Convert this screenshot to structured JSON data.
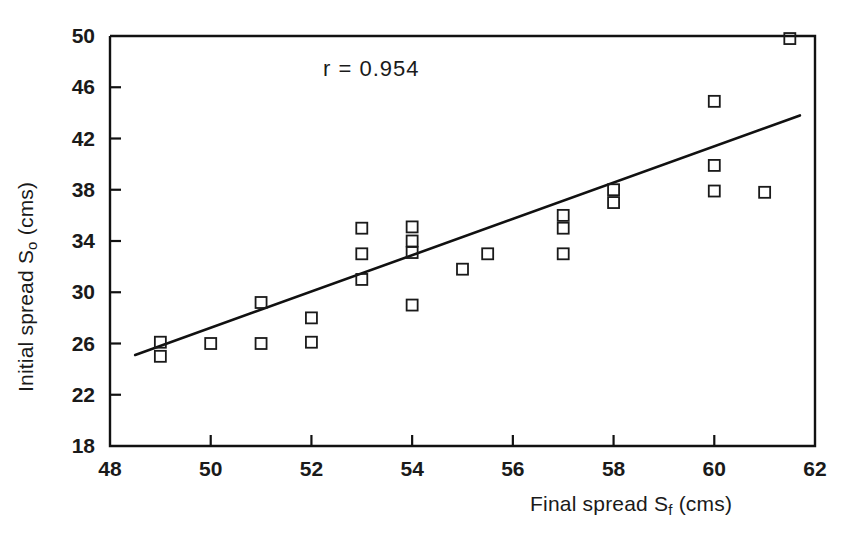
{
  "chart_data": {
    "type": "scatter",
    "title": "",
    "xlabel": "Final spread S_f (cms)",
    "ylabel": "Initial spread S_o (cms)",
    "xlabel_parts": {
      "pre": "Final spread S",
      "sub": "f",
      "post": " (cms)"
    },
    "ylabel_parts": {
      "pre": "Initial spread S",
      "sub": "o",
      "post": " (cms)"
    },
    "xlim": [
      48,
      62
    ],
    "ylim": [
      18,
      50
    ],
    "xticks": [
      48,
      50,
      52,
      54,
      56,
      58,
      60,
      62
    ],
    "yticks": [
      18,
      22,
      26,
      30,
      34,
      38,
      42,
      46,
      50
    ],
    "xtick_labels": [
      "48",
      "50",
      "52",
      "54",
      "56",
      "58",
      "60",
      "62"
    ],
    "ytick_labels": [
      "18",
      "22",
      "26",
      "30",
      "34",
      "38",
      "42",
      "46",
      "50"
    ],
    "grid": false,
    "legend": null,
    "marker": "open-square",
    "marker_color": "#1a1a1a",
    "line_color": "#111111",
    "annotations": [
      {
        "text": "r  =  0.954",
        "x": 54.2,
        "y": 46.3
      }
    ],
    "correlation_r": 0.954,
    "x": [
      49,
      49,
      50,
      51,
      51,
      52,
      52,
      53,
      53,
      53,
      54,
      54,
      54,
      54,
      55,
      55.5,
      57,
      57,
      57,
      58,
      58,
      60,
      60,
      60,
      61,
      61.5
    ],
    "y": [
      26.1,
      25.0,
      26.0,
      29.2,
      26.0,
      28.0,
      26.1,
      35.0,
      33.0,
      31.0,
      35.1,
      34.0,
      33.1,
      29.0,
      31.8,
      33.0,
      36.0,
      35.0,
      33.0,
      38.0,
      37.0,
      44.9,
      39.9,
      37.9,
      37.8,
      49.8
    ],
    "points": [
      [
        49,
        26.1
      ],
      [
        49,
        25.0
      ],
      [
        50,
        26.0
      ],
      [
        51,
        29.2
      ],
      [
        51,
        26.0
      ],
      [
        52,
        28.0
      ],
      [
        52,
        26.1
      ],
      [
        53,
        35.0
      ],
      [
        53,
        33.0
      ],
      [
        53,
        31.0
      ],
      [
        54,
        35.1
      ],
      [
        54,
        34.0
      ],
      [
        54,
        33.1
      ],
      [
        54,
        29.0
      ],
      [
        55,
        31.8
      ],
      [
        55.5,
        33.0
      ],
      [
        57,
        36.0
      ],
      [
        57,
        35.0
      ],
      [
        57,
        33.0
      ],
      [
        58,
        38.0
      ],
      [
        58,
        37.0
      ],
      [
        60,
        44.9
      ],
      [
        60,
        39.9
      ],
      [
        60,
        37.9
      ],
      [
        61,
        37.8
      ],
      [
        61.5,
        49.8
      ]
    ],
    "fit_line": {
      "type": "linear-regression",
      "x_start": 48.5,
      "y_start": 25.1,
      "x_end": 61.7,
      "y_end": 43.8
    }
  }
}
